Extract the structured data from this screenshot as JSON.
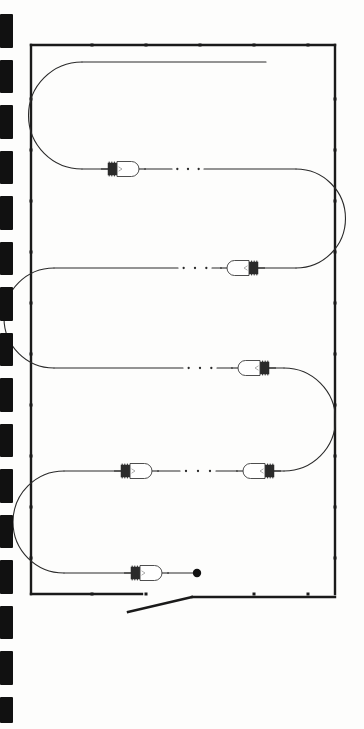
{
  "figure": {
    "title": "Serpentine lamp string figure",
    "type": "technical-line-drawing",
    "background_color": "#fdfdfc",
    "ink_color": "#1a1a1a",
    "canvas": {
      "width": 364,
      "height": 729
    }
  },
  "scan_edge": {
    "name": "film-perforation-marks",
    "color": "#111111",
    "mark_width": 13,
    "marks": [
      {
        "top": 14,
        "height": 34
      },
      {
        "top": 60,
        "height": 33
      },
      {
        "top": 105,
        "height": 34
      },
      {
        "top": 151,
        "height": 33
      },
      {
        "top": 196,
        "height": 34
      },
      {
        "top": 242,
        "height": 33
      },
      {
        "top": 287,
        "height": 34
      },
      {
        "top": 333,
        "height": 33
      },
      {
        "top": 378,
        "height": 34
      },
      {
        "top": 424,
        "height": 33
      },
      {
        "top": 469,
        "height": 34
      },
      {
        "top": 515,
        "height": 33
      },
      {
        "top": 560,
        "height": 34
      },
      {
        "top": 606,
        "height": 33
      },
      {
        "top": 651,
        "height": 34
      },
      {
        "top": 697,
        "height": 26
      }
    ]
  },
  "frame": {
    "name": "figure-border",
    "left": 31,
    "top": 45,
    "right": 335,
    "bottom": 594,
    "stroke_width": 2.4,
    "color": "#1a1a1a",
    "bottom_break": {
      "left_end_x": 142,
      "diagonal_start_x": 128,
      "diagonal_start_y": 612,
      "diagonal_end_x": 192,
      "diagonal_end_y": 597,
      "right_start_x": 192
    },
    "tick_marks": {
      "color": "#1a1a1a",
      "size": 3,
      "top_edge_x": [
        92,
        146,
        200,
        254,
        308
      ],
      "bottom_edge_x": [
        92,
        146,
        254,
        308
      ],
      "left_edge_y": [
        99,
        150,
        201,
        252,
        303,
        354,
        405,
        456,
        507,
        558
      ],
      "right_edge_y": [
        99,
        150,
        201,
        252,
        303,
        354,
        405,
        456,
        507,
        558
      ]
    }
  },
  "wire": {
    "name": "serpentine-conductor",
    "color": "#2a2a2a",
    "stroke_width": 1.1,
    "start_point": {
      "x": 266,
      "y": 62
    },
    "end_terminal": {
      "x": 197,
      "y": 573,
      "radius": 4.2,
      "fill": "#111111"
    },
    "rows": [
      {
        "index": 0,
        "y": 62,
        "x_left": 82,
        "x_right": 266,
        "direction": "right-to-left"
      },
      {
        "index": 1,
        "y": 169,
        "x_left": 82,
        "x_right": 296,
        "direction": "left-to-right"
      },
      {
        "index": 2,
        "y": 268,
        "x_left": 54,
        "x_right": 296,
        "direction": "right-to-left"
      },
      {
        "index": 3,
        "y": 368,
        "x_left": 54,
        "x_right": 284,
        "direction": "left-to-right"
      },
      {
        "index": 4,
        "y": 471,
        "x_left": 64,
        "x_right": 284,
        "direction": "right-to-left"
      },
      {
        "index": 5,
        "y": 573,
        "x_left": 64,
        "x_right": 197,
        "direction": "left-to-right"
      }
    ],
    "bends": [
      {
        "name": "bend-left-1",
        "cx": 82,
        "y_top": 62,
        "y_bottom": 169,
        "side": "left"
      },
      {
        "name": "bend-right-1",
        "cx": 296,
        "y_top": 169,
        "y_bottom": 268,
        "side": "right"
      },
      {
        "name": "bend-left-2",
        "cx": 54,
        "y_top": 268,
        "y_bottom": 368,
        "side": "left"
      },
      {
        "name": "bend-right-2",
        "cx": 284,
        "y_top": 368,
        "y_bottom": 471,
        "side": "right"
      },
      {
        "name": "bend-left-3",
        "cx": 64,
        "y_top": 471,
        "y_bottom": 573,
        "side": "left"
      }
    ],
    "dot_breaks": [
      {
        "name": "wire-break-row1",
        "y": 169,
        "x_start": 172,
        "x_end": 204,
        "dots": 3
      },
      {
        "name": "wire-break-row2",
        "y": 268,
        "x_start": 178,
        "x_end": 212,
        "dots": 3
      },
      {
        "name": "wire-break-row3",
        "y": 368,
        "x_start": 183,
        "x_end": 217,
        "dots": 3
      },
      {
        "name": "wire-break-row4",
        "y": 471,
        "x_start": 180,
        "x_end": 216,
        "dots": 3
      }
    ]
  },
  "lamps": {
    "name": "miniature-lamps",
    "count": 6,
    "glass_fill": "#ffffff",
    "glass_stroke": "#3a3a3a",
    "base_color": "#2b2b2b",
    "items": [
      {
        "id": "lamp-1",
        "x": 128,
        "y": 169,
        "facing": "right",
        "label": "lamp 1",
        "row": 1
      },
      {
        "id": "lamp-2",
        "x": 238,
        "y": 268,
        "facing": "left",
        "label": "lamp 2",
        "row": 2
      },
      {
        "id": "lamp-3",
        "x": 249,
        "y": 368,
        "facing": "left",
        "label": "lamp 3",
        "row": 3
      },
      {
        "id": "lamp-4",
        "x": 141,
        "y": 471,
        "facing": "right",
        "label": "lamp 4",
        "row": 4
      },
      {
        "id": "lamp-5",
        "x": 254,
        "y": 471,
        "facing": "left",
        "label": "lamp 5",
        "row": 4
      },
      {
        "id": "lamp-6",
        "x": 151,
        "y": 573,
        "facing": "right",
        "label": "lamp 6",
        "row": 5
      }
    ],
    "geometry": {
      "glass_length": 22,
      "glass_height": 15,
      "base_length": 9,
      "base_height": 12
    }
  }
}
